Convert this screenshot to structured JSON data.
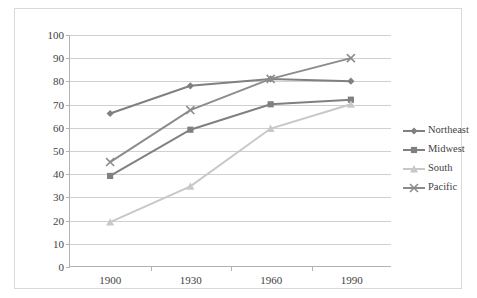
{
  "chart_data": {
    "type": "line",
    "title": "",
    "xlabel": "",
    "ylabel": "",
    "categories": [
      "1900",
      "1930",
      "1960",
      "1990"
    ],
    "x": [
      1900,
      1930,
      1960,
      1990
    ],
    "ylim": [
      0,
      100
    ],
    "yticks": [
      0,
      10,
      20,
      30,
      40,
      50,
      60,
      70,
      80,
      90,
      100
    ],
    "grid": true,
    "legend_position": "right",
    "series": [
      {
        "name": "Northeast",
        "values": [
          66,
          78,
          81,
          80
        ],
        "color": "#808080",
        "marker": "diamond"
      },
      {
        "name": "Midwest",
        "values": [
          39,
          59,
          70,
          72
        ],
        "color": "#808080",
        "marker": "square"
      },
      {
        "name": "South",
        "values": [
          19,
          34.5,
          59.5,
          70
        ],
        "color": "#c8c8c8",
        "marker": "triangle"
      },
      {
        "name": "Pacific",
        "values": [
          45,
          67.5,
          81,
          90
        ],
        "color": "#8c8c8c",
        "marker": "cross"
      }
    ]
  },
  "axis": {
    "y_labels": [
      "100",
      "90",
      "80",
      "70",
      "60",
      "50",
      "40",
      "30",
      "20",
      "10",
      "0"
    ],
    "x_labels": [
      "1900",
      "1930",
      "1960",
      "1990"
    ]
  },
  "legend": {
    "items": [
      {
        "label": "Northeast"
      },
      {
        "label": "Midwest"
      },
      {
        "label": "South"
      },
      {
        "label": "Pacific"
      }
    ]
  }
}
